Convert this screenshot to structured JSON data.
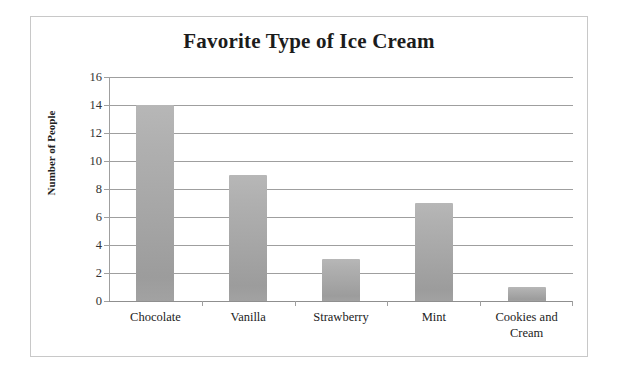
{
  "chart_data": {
    "type": "bar",
    "title": "Favorite Type of Ice Cream",
    "xlabel": "",
    "ylabel": "Number of People",
    "categories": [
      "Chocolate",
      "Vanilla",
      "Strawberry",
      "Mint",
      "Cookies and Cream"
    ],
    "values": [
      14,
      9,
      3,
      7,
      1
    ],
    "ylim": [
      0,
      16
    ],
    "ytick_step": 2,
    "yticks": [
      0,
      2,
      4,
      6,
      8,
      10,
      12,
      14,
      16
    ],
    "ytick_labels": [
      "0",
      "2",
      "4",
      "6",
      "8",
      "10",
      "12",
      "14",
      "16"
    ],
    "grid": true,
    "grid_axis": "y",
    "legend": false,
    "legend_position": "none",
    "bar_color": "#a9a9a9",
    "gridline_color": "#9f9f9f",
    "title_color": "#1c1c1c",
    "border_color": "#c8c8c8",
    "background_color": "#ffffff"
  }
}
